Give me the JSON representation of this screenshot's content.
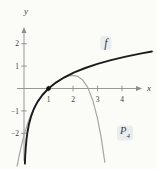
{
  "figure": {
    "background": "#fbfbf8"
  },
  "labels": {
    "f": "f",
    "p4_base": "P",
    "p4_sub": "4",
    "x_axis": "x",
    "y_axis": "y"
  },
  "chart_data": {
    "type": "line",
    "title": "",
    "xlabel": "x",
    "ylabel": "y",
    "xlim": [
      -0.3,
      5.3
    ],
    "ylim": [
      -3.6,
      2.9
    ],
    "grid": false,
    "legend": "inline-annotations",
    "axis_color": "#8c8c8c",
    "tick_label_color": "#3a3a3a",
    "x_ticks": [
      {
        "value": 1,
        "label": "1"
      },
      {
        "value": 2,
        "label": "2"
      },
      {
        "value": 3,
        "label": "3"
      },
      {
        "value": 4,
        "label": "4"
      }
    ],
    "y_ticks": [
      {
        "value": 2,
        "label": "2"
      },
      {
        "value": 1,
        "label": "1"
      },
      {
        "value": -1,
        "label": "−1"
      },
      {
        "value": -2,
        "label": "−2"
      }
    ],
    "series": [
      {
        "name": "P4",
        "color": "#a6a6a6",
        "stroke_width": 1.2,
        "points": [
          [
            -0.28,
            -3.469
          ],
          [
            -0.2,
            -3.014
          ],
          [
            -0.1,
            -2.515
          ],
          [
            0,
            -2.083
          ],
          [
            0.15,
            -1.546
          ],
          [
            0.3,
            -1.119
          ],
          [
            0.5,
            -0.682
          ],
          [
            0.7,
            -0.356
          ],
          [
            0.9,
            -0.105
          ],
          [
            1,
            0
          ],
          [
            1.2,
            0.182
          ],
          [
            1.4,
            0.335
          ],
          [
            1.6,
            0.46
          ],
          [
            1.8,
            0.548
          ],
          [
            2,
            0.583
          ],
          [
            2.2,
            0.538
          ],
          [
            2.4,
            0.374
          ],
          [
            2.6,
            0.047
          ],
          [
            2.8,
            -0.5
          ],
          [
            3,
            -1.333
          ],
          [
            3.15,
            -2.19
          ],
          [
            3.3,
            -3.285
          ]
        ]
      },
      {
        "name": "f",
        "color": "#1b1b1b",
        "stroke_width": 1.9,
        "points": [
          [
            0.035,
            -3.352
          ],
          [
            0.05,
            -2.996
          ],
          [
            0.07,
            -2.659
          ],
          [
            0.1,
            -2.303
          ],
          [
            0.14,
            -1.966
          ],
          [
            0.2,
            -1.609
          ],
          [
            0.28,
            -1.273
          ],
          [
            0.4,
            -0.916
          ],
          [
            0.55,
            -0.598
          ],
          [
            0.75,
            -0.288
          ],
          [
            1,
            0
          ],
          [
            1.3,
            0.262
          ],
          [
            1.65,
            0.501
          ],
          [
            2.05,
            0.718
          ],
          [
            2.5,
            0.916
          ],
          [
            3,
            1.099
          ],
          [
            3.55,
            1.267
          ],
          [
            4.15,
            1.423
          ],
          [
            4.8,
            1.569
          ],
          [
            5.22,
            1.653
          ]
        ]
      }
    ],
    "marked_points": [
      {
        "x": 1,
        "y": 0,
        "style": "filled-dot",
        "color": "#111111"
      }
    ],
    "annotations": [
      {
        "text": "f",
        "attached_to": "curve-f"
      },
      {
        "text": "P4",
        "attached_to": "curve-p4"
      }
    ]
  }
}
